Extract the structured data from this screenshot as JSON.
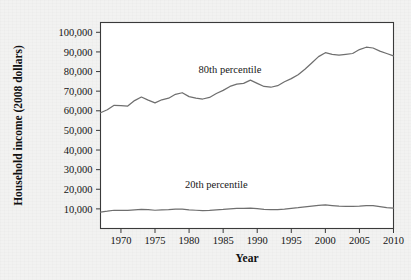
{
  "chart_data": {
    "type": "line",
    "title": "",
    "xlabel": "Year",
    "ylabel": "Household income (2008 dollars)",
    "xlim": [
      1967,
      2010
    ],
    "ylim": [
      0,
      105000
    ],
    "grid": false,
    "legend_position": "inline-annotation",
    "xticks": [
      "1970",
      "1975",
      "1980",
      "1985",
      "1990",
      "1995",
      "2000",
      "2005",
      "2010"
    ],
    "xtick_values": [
      1970,
      1975,
      1980,
      1985,
      1990,
      1995,
      2000,
      2005,
      2010
    ],
    "yticks": [
      "10,000",
      "20,000",
      "30,000",
      "40,000",
      "50,000",
      "60,000",
      "70,000",
      "80,000",
      "90,000",
      "100,000"
    ],
    "ytick_values": [
      10000,
      20000,
      30000,
      40000,
      50000,
      60000,
      70000,
      80000,
      90000,
      100000
    ],
    "annotations": [
      {
        "text": "80th percentile",
        "x": 1986,
        "y": 79500
      },
      {
        "text": "20th percentile",
        "x": 1984,
        "y": 20500
      }
    ],
    "line_color": "#6f6f6f",
    "series": [
      {
        "name": "80th percentile",
        "x": [
          1967,
          1968,
          1969,
          1970,
          1971,
          1972,
          1973,
          1974,
          1975,
          1976,
          1977,
          1978,
          1979,
          1980,
          1981,
          1982,
          1983,
          1984,
          1985,
          1986,
          1987,
          1988,
          1989,
          1990,
          1991,
          1992,
          1993,
          1994,
          1995,
          1996,
          1997,
          1998,
          1999,
          2000,
          2001,
          2002,
          2003,
          2004,
          2005,
          2006,
          2007,
          2008,
          2009,
          2010
        ],
        "values": [
          59000,
          60500,
          62800,
          62600,
          62400,
          65200,
          67000,
          65400,
          64000,
          65600,
          66400,
          68400,
          69200,
          67200,
          66400,
          66000,
          66800,
          68800,
          70400,
          72400,
          73600,
          74000,
          75600,
          74000,
          72400,
          72000,
          72800,
          74800,
          76400,
          78400,
          81200,
          84400,
          87600,
          89600,
          88800,
          88400,
          88800,
          89200,
          91200,
          92400,
          92000,
          90400,
          89200,
          88000
        ]
      },
      {
        "name": "20th percentile",
        "x": [
          1967,
          1968,
          1969,
          1970,
          1971,
          1972,
          1973,
          1974,
          1975,
          1976,
          1977,
          1978,
          1979,
          1980,
          1981,
          1982,
          1983,
          1984,
          1985,
          1986,
          1987,
          1988,
          1989,
          1990,
          1991,
          1992,
          1993,
          1994,
          1995,
          1996,
          1997,
          1998,
          1999,
          2000,
          2001,
          2002,
          2003,
          2004,
          2005,
          2006,
          2007,
          2008,
          2009,
          2010
        ],
        "values": [
          8400,
          8800,
          9300,
          9300,
          9200,
          9500,
          9800,
          9600,
          9300,
          9500,
          9600,
          9900,
          9900,
          9500,
          9300,
          9100,
          9200,
          9500,
          9700,
          10000,
          10200,
          10200,
          10400,
          10100,
          9700,
          9600,
          9600,
          9900,
          10300,
          10600,
          11000,
          11400,
          11800,
          12000,
          11700,
          11400,
          11300,
          11300,
          11400,
          11600,
          11700,
          11200,
          10700,
          10400
        ]
      }
    ]
  }
}
